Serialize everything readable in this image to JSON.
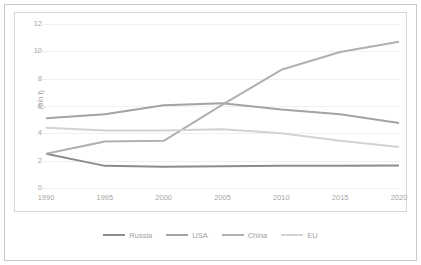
{
  "chart_data": {
    "type": "line",
    "title": "",
    "xlabel": "",
    "ylabel": "(bln t)",
    "x": [
      1990,
      1995,
      2000,
      2005,
      2010,
      2015,
      2020
    ],
    "xtick_labels": [
      "1990",
      "1995",
      "2000",
      "2005",
      "2010",
      "2015",
      "2020"
    ],
    "ytick_labels": [
      "0",
      "2",
      "4",
      "6",
      "8",
      "10",
      "12"
    ],
    "yticks": [
      0,
      2,
      4,
      6,
      8,
      10,
      12
    ],
    "ylim": [
      0,
      12
    ],
    "grid": "horizontal",
    "legend_position": "bottom-center",
    "series": [
      {
        "name": "Russia",
        "color": "#8c8c8c",
        "values": [
          2.5,
          1.62,
          1.55,
          1.6,
          1.62,
          1.63,
          1.65
        ]
      },
      {
        "name": "USA",
        "color": "#a3a3a3",
        "values": [
          5.1,
          5.4,
          6.05,
          6.2,
          5.75,
          5.4,
          4.75
        ]
      },
      {
        "name": "China",
        "color": "#b0b0b0",
        "values": [
          2.5,
          3.4,
          3.45,
          6.1,
          8.65,
          9.95,
          10.7
        ]
      },
      {
        "name": "EU",
        "color": "#d2d2d2",
        "values": [
          4.4,
          4.2,
          4.2,
          4.3,
          4.0,
          3.45,
          3.0
        ]
      }
    ]
  },
  "frame": {
    "border_color": "#c9c9c9",
    "plot_border_color": "#d8d8d8",
    "background": "#ffffff",
    "grid_color": "#f0f0f0",
    "tick_text_color": "#a6a6a6"
  }
}
